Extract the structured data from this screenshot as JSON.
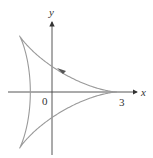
{
  "diagram": {
    "type": "parametric-curve",
    "curve_name": "deltoid",
    "axis_labels": {
      "x": "x",
      "y": "y"
    },
    "tick_labels": {
      "origin": "0",
      "x_intercept": "3"
    },
    "cusps": [
      [
        3,
        0
      ],
      [
        -1.5,
        2.598
      ],
      [
        -1.5,
        -2.598
      ]
    ],
    "direction": "counterclockwise",
    "colors": {
      "curve": "#9a9a9a",
      "axes": "#444444",
      "arrow": "#555555"
    }
  }
}
